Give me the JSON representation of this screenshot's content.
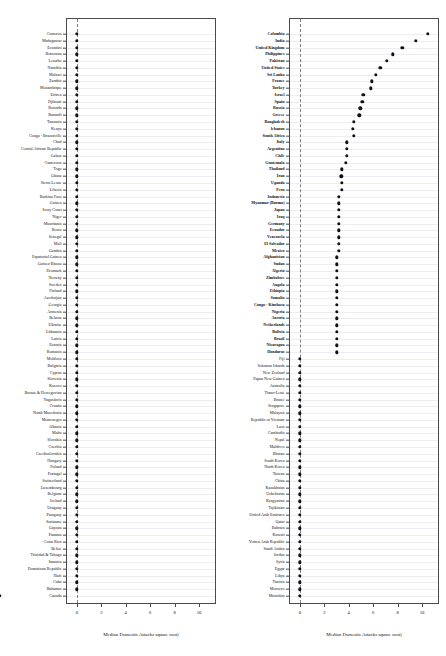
{
  "figure": {
    "type": "two-panel-dot-plot",
    "width": 446,
    "height": 656,
    "background": "#ffffff",
    "dot_color": "#111111",
    "frame_color": "#4a4a4a",
    "gridline_color": "#eeeef2",
    "zeroline_color": "#808080"
  },
  "axis": {
    "xlabel": "Median Domestic Attacks square root)",
    "ticks": [
      "0",
      "2",
      "4",
      "6",
      "8",
      "10"
    ],
    "tick_values": [
      0,
      2,
      4,
      6,
      8,
      10
    ],
    "xlim": [
      -0.9,
      11.4
    ]
  },
  "chart_data": {
    "type": "scatter",
    "title": "",
    "xlabel": "Median Domestic Attacks square root)",
    "ylabel": "",
    "xlim": [
      -0.9,
      11.4
    ],
    "grid": true,
    "legend": "none",
    "panels": [
      {
        "name": "left-panel",
        "categories": [
          "Comoros",
          "Madagascar",
          "Eswatini",
          "Botswana",
          "Lesotho",
          "Namibia",
          "Malawi",
          "Zambia",
          "Mozambique",
          "Eritrea",
          "Djibouti",
          "Rwanda",
          "Burundi",
          "Tanzania",
          "Kenya",
          "Congo - Brazzaville",
          "Chad",
          "Central African Republic",
          "Gabon",
          "Cameroon",
          "Togo",
          "Ghana",
          "Sierra Leone",
          "Liberia",
          "Burkina Faso",
          "Guinea",
          "Ivory Coast",
          "Niger",
          "Mauritania",
          "Benin",
          "Senegal",
          "Mali",
          "Gambia",
          "Equatorial Guinea",
          "Guinea-Bissau",
          "Denmark",
          "Norway",
          "Sweden",
          "Finland",
          "Azerbaijan",
          "Georgia",
          "Armenia",
          "Belarus",
          "Ukraine",
          "Lithuania",
          "Latvia",
          "Estonia",
          "Romania",
          "Moldova",
          "Bulgaria",
          "Cyprus",
          "Slovenia",
          "Kosovo",
          "Bosnia & Herzegovina",
          "Yugoslavia",
          "Croatia",
          "North Macedonia",
          "Montenegro",
          "Albania",
          "Malta",
          "Slovakia",
          "Czechia",
          "Czechoslovakia",
          "Hungary",
          "Poland",
          "Portugal",
          "Switzerland",
          "Luxembourg",
          "Belgium",
          "Ireland",
          "Uruguay",
          "Paraguay",
          "Suriname",
          "Guyana",
          "Panama",
          "Costa Rica",
          "Belize",
          "Trinidad & Tobago",
          "Jamaica",
          "Dominican Republic",
          "Haiti",
          "Cuba",
          "Bahamas",
          "Canada"
        ],
        "values": [
          0,
          0,
          0,
          0,
          0,
          0,
          0,
          0,
          0,
          0,
          0,
          0,
          0,
          0,
          0,
          0,
          0,
          0,
          0,
          0,
          0,
          0,
          0,
          0,
          0,
          0,
          0,
          0,
          0,
          0,
          0,
          0,
          0,
          0,
          0,
          0,
          0,
          0,
          0,
          0,
          0,
          0,
          0,
          0,
          0,
          0,
          0,
          0,
          0,
          0,
          0,
          0,
          0,
          0,
          0,
          0,
          0,
          0,
          0,
          0,
          0,
          0,
          0,
          0,
          0,
          0,
          0,
          0,
          0,
          0,
          0,
          0,
          0,
          0,
          0,
          0,
          0,
          0,
          0,
          0,
          0,
          0,
          0
        ],
        "bold": []
      },
      {
        "name": "right-panel",
        "categories": [
          "Colombia",
          "India",
          "United Kingdom",
          "Philippines",
          "Pakistan",
          "United States",
          "Sri Lanka",
          "France",
          "Turkey",
          "Israel",
          "Spain",
          "Russia",
          "Greece",
          "Bangladesh",
          "lebanon",
          "South Africa",
          "Italy",
          "Argentina",
          "Chile",
          "Guatemala",
          "Thailand",
          "Iran",
          "Uganda",
          "Peru",
          "Indonesia",
          "Myanmar (Burma)",
          "Japan",
          "Iraq",
          "Germany",
          "Ecuador",
          "Venezuela",
          "El Salvador",
          "Mexico",
          "Afghanistan",
          "Sudan",
          "Algeria",
          "Zimbabwe",
          "Angola",
          "Ethiopia",
          "Somalia",
          "Congo - Kinshasa",
          "Nigeria",
          "Austria",
          "Netherlands",
          "Bolivia",
          "Brazil",
          "Nicaragua",
          "Honduras",
          "Fiji",
          "Solomon Islands",
          "New Zealand",
          "Papua New Guinea",
          "Australia",
          "Timor-Leste",
          "Brunei",
          "Singapore",
          "Malaysia",
          "Republic of Vietnam",
          "Laos",
          "Cambodia",
          "Nepal",
          "Maldives",
          "Bhutan",
          "South Korea",
          "North Korea",
          "Taiwan",
          "China",
          "Kazakhstan",
          "Uzbekistan",
          "Kyrgyzstan",
          "Tajikistan",
          "United Arab Emirates",
          "Qatar",
          "Bahrain",
          "Kuwait",
          "Yemen Arab Republic",
          "Saudi Arabia",
          "Jordan",
          "Syria",
          "Egypt",
          "Libya",
          "Tunisia",
          "Morocco",
          "Mauritius"
        ],
        "values": [
          10.5,
          9.5,
          8.4,
          7.6,
          7.1,
          6.6,
          6.2,
          5.9,
          5.8,
          5.2,
          5.1,
          4.95,
          4.85,
          4.4,
          4.35,
          4.4,
          3.85,
          3.85,
          3.85,
          3.75,
          3.45,
          3.4,
          3.45,
          3.45,
          3.2,
          3.2,
          3.2,
          3.2,
          3.2,
          3.2,
          3.2,
          3.2,
          3.2,
          3.0,
          3.0,
          3.0,
          3.0,
          3.0,
          3.0,
          3.0,
          3.0,
          3.0,
          3.0,
          3.0,
          3.0,
          3.0,
          3.0,
          3.0,
          0,
          0,
          0,
          0,
          0,
          0,
          0,
          0,
          0,
          0,
          0,
          0,
          0,
          0,
          0,
          0,
          0,
          0,
          0,
          0,
          0,
          0,
          0,
          0,
          0,
          0,
          0,
          0,
          0,
          0,
          0,
          0,
          0,
          0,
          0,
          0
        ],
        "bold": [
          "Colombia",
          "India",
          "United Kingdom",
          "Philippines",
          "Pakistan",
          "United States",
          "Sri Lanka",
          "France",
          "Turkey",
          "Israel",
          "Spain",
          "Russia",
          "Greece",
          "Bangladesh",
          "lebanon",
          "South Africa",
          "Italy",
          "Argentina",
          "Chile",
          "Guatemala",
          "Thailand",
          "Iran",
          "Uganda",
          "Peru",
          "Indonesia",
          "Myanmar (Burma)",
          "Japan",
          "Iraq",
          "Germany",
          "Ecuador",
          "Venezuela",
          "El Salvador",
          "Mexico",
          "Afghanistan",
          "Sudan",
          "Algeria",
          "Zimbabwe",
          "Angola",
          "Ethiopia",
          "Somalia",
          "Congo - Kinshasa",
          "Nigeria",
          "Austria",
          "Netherlands",
          "Bolivia",
          "Brazil",
          "Nicaragua",
          "Honduras"
        ]
      }
    ]
  }
}
